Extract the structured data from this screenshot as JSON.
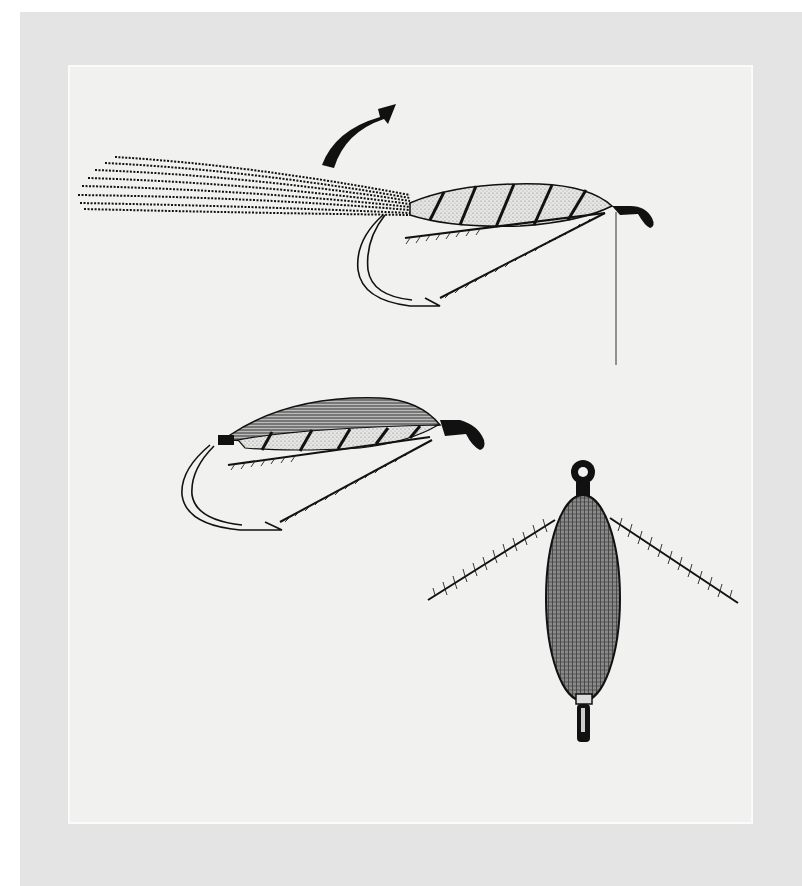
{
  "figure": {
    "colors": {
      "page": "#ffffff",
      "mat": "#e4e4e4",
      "panel": "#f1f1f0",
      "ink": "#111111",
      "body_fill": "#d8d8d6"
    },
    "elements": [
      {
        "id": "arrow",
        "icon": "curved-arrow-up-right"
      },
      {
        "id": "fly-1",
        "label": "wing fibres tied in, lying back over tail"
      },
      {
        "id": "fly-2",
        "label": "wing folded forward over body"
      },
      {
        "id": "fly-3",
        "label": "top view of finished body with hackle"
      }
    ]
  }
}
